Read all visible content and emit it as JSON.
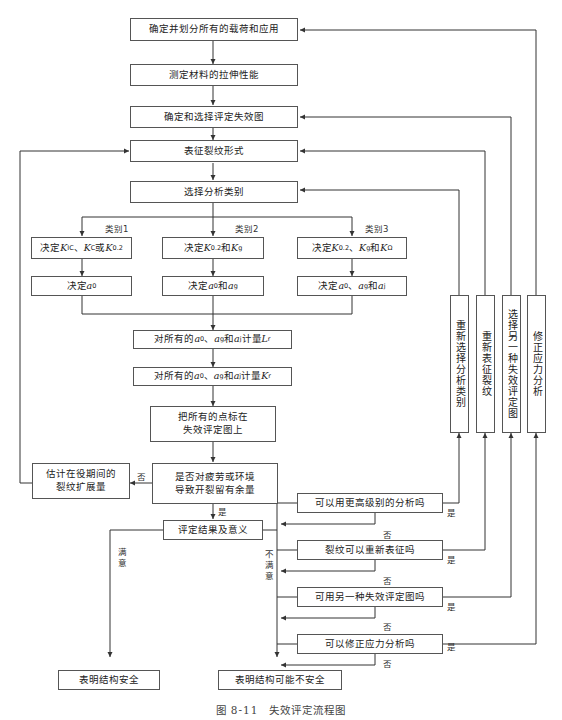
{
  "figure": {
    "caption": "图 8-11　失效评定流程图"
  },
  "nodes": {
    "define_loads": "确定并划分所有的载荷和应用",
    "tensile_props": "测定材料的拉伸性能",
    "select_fad": "确定和选择评定失效图",
    "characterize_crack": "表征裂纹形式",
    "select_category": "选择分析类别",
    "cat1_k": "决定K_IC、K_C或K_0.2",
    "cat2_k": "决定K_0.2和K_g",
    "cat3_k": "决定K_0.2、K_g和K_Ω",
    "cat1_a": "决定a_0",
    "cat2_a": "决定a_0和a_g",
    "cat3_a": "决定a_0、a_g和a_j",
    "calc_lr": "对所有的a_0、a_g和a_j计量L_r",
    "calc_kr": "对所有的a_0、a_g和a_j计量K_r",
    "plot_points_line1": "把所有的点标在",
    "plot_points_line2": "失效评定图上",
    "fatigue_line1": "是否对疲劳或环境",
    "fatigue_line2": "导致开裂留有余量",
    "estimate_line1": "估计在役期间的",
    "estimate_line2": "裂纹扩展量",
    "results": "评定结果及意义",
    "q_higher_level": "可以用更高级别的分析吗",
    "q_recharacterize": "裂纹可以重新表征吗",
    "q_other_fad": "可用另一种失效评定图吗",
    "q_modify_stress": "可以修正应力分析吗",
    "safe": "表明结构安全",
    "maybe_unsafe": "表明结构可能不安全",
    "side_reselect_category": "重新选择分析类别",
    "side_recharacterize": "重新表征裂纹",
    "side_other_fad": "选择另一种失效评定图",
    "side_modify_stress": "修正应力分析"
  },
  "labels": {
    "category1": "类别1",
    "category2": "类别2",
    "category3": "类别3",
    "no": "否",
    "yes": "是",
    "satisfied": "满意",
    "unsatisfied": "不满意"
  }
}
